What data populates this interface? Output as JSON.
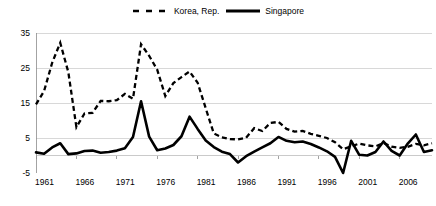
{
  "chart_data": {
    "type": "line",
    "title": "",
    "xlabel": "",
    "ylabel": "",
    "xlim": [
      1961,
      2010
    ],
    "ylim": [
      -5,
      35
    ],
    "yticks": [
      35,
      25,
      15,
      5,
      -5
    ],
    "xticks": [
      1961,
      1966,
      1971,
      1976,
      1981,
      1986,
      1991,
      1996,
      2001,
      2006
    ],
    "grid": true,
    "legend_position": "top-center",
    "x": [
      1961,
      1962,
      1963,
      1964,
      1965,
      1966,
      1967,
      1968,
      1969,
      1970,
      1971,
      1972,
      1973,
      1974,
      1975,
      1976,
      1977,
      1978,
      1979,
      1980,
      1981,
      1982,
      1983,
      1984,
      1985,
      1986,
      1987,
      1988,
      1989,
      1990,
      1991,
      1992,
      1993,
      1994,
      1995,
      1996,
      1997,
      1998,
      1999,
      2000,
      2001,
      2002,
      2003,
      2004,
      2005,
      2006,
      2007,
      2008,
      2009,
      2010
    ],
    "series": [
      {
        "name": "Korea, Rep.",
        "style": "dashed",
        "color": "#000000",
        "values": [
          14.6,
          18.4,
          26.5,
          32.2,
          23.8,
          8.1,
          12.0,
          12.2,
          15.6,
          15.5,
          15.8,
          17.6,
          16.2,
          31.8,
          28.5,
          24.5,
          17.0,
          20.7,
          22.4,
          24.0,
          20.8,
          13.5,
          6.3,
          5.2,
          4.7,
          4.6,
          5.1,
          7.8,
          7.0,
          9.3,
          9.6,
          7.6,
          6.8,
          7.0,
          6.2,
          5.6,
          5.0,
          3.8,
          1.8,
          2.6,
          3.4,
          2.9,
          2.6,
          3.6,
          2.5,
          2.2,
          2.5,
          3.3,
          2.9,
          3.5
        ]
      },
      {
        "name": "Singapore",
        "style": "solid",
        "color": "#000000",
        "values": [
          0.9,
          0.5,
          2.3,
          3.5,
          0.4,
          0.6,
          1.3,
          1.4,
          0.8,
          1.0,
          1.4,
          2.1,
          5.3,
          15.5,
          5.4,
          1.5,
          2.0,
          3.0,
          5.5,
          11.1,
          7.6,
          4.3,
          2.4,
          1.1,
          0.4,
          -2.0,
          -0.2,
          1.1,
          2.3,
          3.5,
          5.3,
          4.2,
          3.8,
          4.0,
          3.3,
          2.3,
          1.2,
          -0.4,
          -5.0,
          4.2,
          0.2,
          0.0,
          1.0,
          4.0,
          1.3,
          0.0,
          3.4,
          6.0,
          1.0,
          1.5
        ]
      }
    ]
  },
  "legend": {
    "entries": [
      {
        "label": "Korea, Rep.",
        "marker": "dashed-line-swatch"
      },
      {
        "label": "Singapore",
        "marker": "solid-line-swatch"
      }
    ]
  },
  "axes": {
    "y_tick_labels": [
      "35",
      "25",
      "15",
      "5",
      "-5"
    ],
    "x_tick_labels": [
      "1961",
      "1966",
      "1971",
      "1976",
      "1981",
      "1986",
      "1991",
      "1996",
      "2001",
      "2006"
    ]
  },
  "colors": {
    "series": "#000000",
    "grid": "#c8c8c8",
    "axis": "#8c8c8c",
    "background": "#ffffff"
  }
}
